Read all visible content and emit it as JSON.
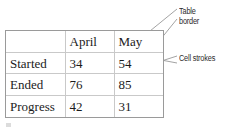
{
  "figure": {
    "kind": "annotated-table-diagram",
    "background_color": "#ffffff"
  },
  "table": {
    "border_color": "#9a9a9a",
    "cell_stroke_color": "#c9c9c9",
    "text_color": "#1b1b1b",
    "columns": [
      "",
      "April",
      "May"
    ],
    "rows": [
      {
        "label": "Started",
        "april": "34",
        "may": "54"
      },
      {
        "label": "Ended",
        "april": "76",
        "may": "85"
      },
      {
        "label": "Progress",
        "april": "42",
        "may": "31"
      }
    ]
  },
  "annotations": {
    "table_border": {
      "label_line1": "Table",
      "label_line2": "border"
    },
    "cell_strokes": {
      "label": "Cell strokes"
    },
    "leader_line_color": "#8c8c8c"
  }
}
